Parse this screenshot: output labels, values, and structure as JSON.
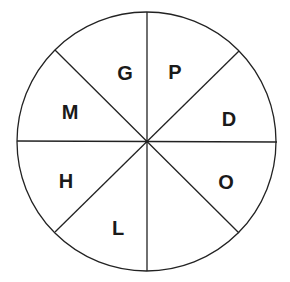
{
  "diagram": {
    "type": "circle divided into 8 equal sectors",
    "center": [
      146,
      142
    ],
    "radius": 129,
    "stroke_color": "#222222",
    "background": "#ffffff",
    "sectors": [
      {
        "position": "top-left-upper",
        "label": "G"
      },
      {
        "position": "top-right-upper",
        "label": "P"
      },
      {
        "position": "right-upper",
        "label": "D"
      },
      {
        "position": "right-lower",
        "label": "O"
      },
      {
        "position": "bottom-right-lower",
        "label": ""
      },
      {
        "position": "bottom-left-lower",
        "label": "L"
      },
      {
        "position": "left-lower",
        "label": "H"
      },
      {
        "position": "left-upper",
        "label": "M"
      }
    ]
  }
}
